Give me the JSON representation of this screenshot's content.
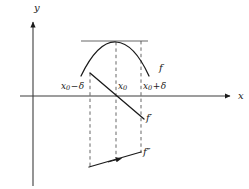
{
  "figure": {
    "background_color": "#ffffff",
    "ink_color": "#1a1a1a",
    "guide_color": "#8c8c8c",
    "axes": {
      "y_label": "y",
      "x_label": "x",
      "x_axis_y_px": 96,
      "y_axis_x_px": 33,
      "x_axis_start_px": 20,
      "x_axis_end_px": 232,
      "y_axis_top_px": 20,
      "y_axis_bottom_px": 186
    },
    "ticks": [
      {
        "name": "x0-minus-delta",
        "text_main": "x",
        "text_sub": "0",
        "text_op": "−",
        "text_tail": "δ",
        "x_px": 90
      },
      {
        "name": "x0",
        "text_main": "x",
        "text_sub": "0",
        "text_op": "",
        "text_tail": "",
        "x_px": 116
      },
      {
        "name": "x0-plus-delta",
        "text_main": "x",
        "text_sub": "0",
        "text_op": "+",
        "text_tail": "δ",
        "x_px": 141
      }
    ],
    "dashed_verticals": [
      {
        "name": "dashed-left",
        "x_px": 90,
        "y_top_px": 73,
        "y_bottom_px": 167
      },
      {
        "name": "dashed-center",
        "x_px": 116,
        "y_top_px": 42,
        "y_bottom_px": 163
      },
      {
        "name": "dashed-right",
        "x_px": 141,
        "y_top_px": 41,
        "y_bottom_px": 153
      }
    ],
    "horizontal_guide": {
      "name": "tangent-guide-line",
      "x_start_px": 81,
      "x_end_px": 148,
      "y_px": 41
    },
    "curves": {
      "f": {
        "label": "f",
        "description": "downward opening parabola with maximum at x0",
        "path": "M 81 76 Q 98 41 116 42 Q 134 43 149 76"
      },
      "f_prime": {
        "label": "f′",
        "description": "decreasing straight line crossing zero at x0",
        "x_start_px": 90,
        "y_start_px": 73,
        "x_end_px": 144,
        "y_end_px": 119
      },
      "f_double_prime": {
        "label": "f″",
        "description": "negative constant-ish segment below the axis with arrow at x0",
        "x_start_px": 89,
        "y_start_px": 167,
        "x_end_px": 141,
        "y_end_px": 152,
        "arrow_x_px": 116,
        "arrow_y_px": 160
      }
    }
  }
}
